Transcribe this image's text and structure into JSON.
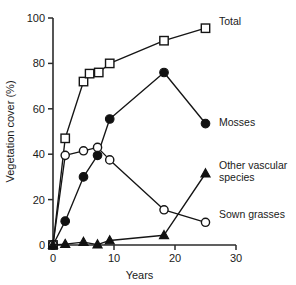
{
  "chart_data": {
    "type": "line",
    "title": "",
    "xlabel": "Years",
    "ylabel": "Vegetation cover (%)",
    "xlim": [
      0,
      30
    ],
    "ylim": [
      0,
      100
    ],
    "xticks": [
      0,
      10,
      20,
      30
    ],
    "yticks": [
      0,
      20,
      40,
      60,
      80,
      100
    ],
    "xtick_labels": [
      "0",
      "10",
      "20",
      "30"
    ],
    "ytick_labels": [
      "0",
      "20",
      "40",
      "60",
      "80",
      "100"
    ],
    "grid": false,
    "legend_position": "right-inline-labels",
    "series": [
      {
        "name": "Total",
        "marker": "open-square",
        "points": [
          {
            "x": 0,
            "y": 0
          },
          {
            "x": 2,
            "y": 47
          },
          {
            "x": 5,
            "y": 72
          },
          {
            "x": 6,
            "y": 75.5
          },
          {
            "x": 7.5,
            "y": 76
          },
          {
            "x": 9.3,
            "y": 80
          },
          {
            "x": 18.2,
            "y": 90
          },
          {
            "x": 25,
            "y": 95.5
          }
        ]
      },
      {
        "name": "Mosses",
        "marker": "filled-circle",
        "points": [
          {
            "x": 0,
            "y": 0
          },
          {
            "x": 2,
            "y": 10.5
          },
          {
            "x": 5,
            "y": 30
          },
          {
            "x": 7.3,
            "y": 39.5
          },
          {
            "x": 9.3,
            "y": 55.5
          },
          {
            "x": 18.2,
            "y": 76
          },
          {
            "x": 25,
            "y": 53.5
          }
        ]
      },
      {
        "name": "Sown grasses",
        "marker": "open-circle",
        "points": [
          {
            "x": 0,
            "y": 0
          },
          {
            "x": 2,
            "y": 39.5
          },
          {
            "x": 5,
            "y": 41.5
          },
          {
            "x": 7.3,
            "y": 43
          },
          {
            "x": 9.3,
            "y": 37.5
          },
          {
            "x": 18.2,
            "y": 15.5
          },
          {
            "x": 25,
            "y": 10
          }
        ]
      },
      {
        "name": "Other vascular species",
        "marker": "filled-triangle",
        "points": [
          {
            "x": 0,
            "y": 0
          },
          {
            "x": 2,
            "y": 0.4
          },
          {
            "x": 5,
            "y": 1.3
          },
          {
            "x": 7.3,
            "y": 0.2
          },
          {
            "x": 9.3,
            "y": 2
          },
          {
            "x": 18.2,
            "y": 4.3
          },
          {
            "x": 25,
            "y": 31.5
          }
        ]
      }
    ]
  },
  "legend": {
    "total": "Total",
    "mosses": "Mosses",
    "other_vascular_line1": "Other vascular",
    "other_vascular_line2": "species",
    "sown_grasses": "Sown grasses"
  },
  "axes": {
    "x_title": "Years",
    "y_title": "Vegetation cover (%)"
  },
  "colors": {
    "ink": "#151515",
    "background": "#ffffff"
  }
}
